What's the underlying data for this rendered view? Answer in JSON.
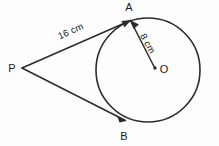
{
  "figure": {
    "type": "geometry-diagram",
    "background_color": "#fdfdfd",
    "ink_color": "#2b2b2b",
    "points": [
      {
        "id": "P",
        "label": "P",
        "role": "external-point",
        "x": 22,
        "y": 68,
        "label_x": 12,
        "label_y": 72
      },
      {
        "id": "A",
        "label": "A",
        "role": "tangent-point-upper",
        "x": 130,
        "y": 20,
        "label_x": 126,
        "label_y": 11
      },
      {
        "id": "B",
        "label": "B",
        "role": "tangent-point-lower",
        "x": 125,
        "y": 121,
        "label_x": 121,
        "label_y": 140
      },
      {
        "id": "O",
        "label": "O",
        "role": "circle-center",
        "x": 155,
        "y": 68,
        "label_x": 161,
        "label_y": 73
      }
    ],
    "circle": {
      "center_x": 148,
      "center_y": 70,
      "radius": 52,
      "stroke_width": 1.6
    },
    "segments": [
      {
        "id": "PA",
        "from": "P",
        "to": "A",
        "label": "16 cm",
        "arrowhead_at": "A",
        "label_x": 72,
        "label_y": 34,
        "label_rotation": -24,
        "stroke_width": 1.5
      },
      {
        "id": "PB",
        "from": "P",
        "to": "B",
        "label": "",
        "arrowhead_at": "B",
        "stroke_width": 1.5
      },
      {
        "id": "AO",
        "from": "A",
        "to": "O",
        "label": "8 cm",
        "arrowhead_at": "A",
        "label_x": 145,
        "label_y": 45,
        "label_rotation": 61,
        "stroke_width": 1.5
      }
    ],
    "measurements": [
      {
        "segment": "PA",
        "value": "16 cm",
        "quantity": 16,
        "unit": "cm"
      },
      {
        "segment": "AO",
        "value": "8 cm",
        "quantity": 8,
        "unit": "cm"
      }
    ]
  }
}
